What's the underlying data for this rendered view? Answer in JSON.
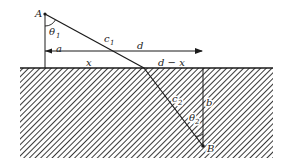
{
  "diagram": {
    "type": "refraction-geometry",
    "colors": {
      "line": "#1a1a1a",
      "hatch": "#3a3a3a",
      "background": "#ffffff"
    },
    "points": {
      "A": {
        "label": "A",
        "x": 45,
        "y": 14
      },
      "B": {
        "label": "B",
        "x": 203,
        "y": 146
      },
      "refraction_point": {
        "x": 144,
        "y": 68
      }
    },
    "boundary": {
      "y": 68,
      "x_start": 20,
      "x_end": 273
    },
    "labels": {
      "A": "A",
      "B": "B",
      "theta1": "θ",
      "theta1_sub": "1",
      "theta2": "θ",
      "theta2_sub": "2",
      "c1": "c",
      "c1_sub": "1",
      "c2": "c",
      "c2_sub": "2",
      "a": "a",
      "d": "d",
      "x": "x",
      "d_minus_x": "d − x",
      "b": "b"
    },
    "arrow_d": {
      "y": 51,
      "x_start": 45,
      "x_end": 203
    }
  }
}
